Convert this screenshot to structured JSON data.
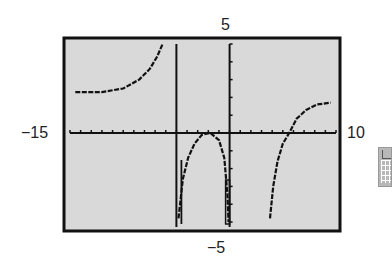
{
  "chart_data": {
    "type": "line",
    "title": "",
    "xlabel": "",
    "ylabel": "",
    "xlim": [
      -15,
      10
    ],
    "ylim": [
      -5,
      5
    ],
    "grid": false,
    "axis_tick_labels": {
      "xmin": "−15",
      "xmax": "10",
      "ymax": "5",
      "ymin": "−5"
    },
    "x_scale_ticks": 1,
    "y_scale_ticks": 1,
    "vertical_asymptotes": [
      -5,
      0
    ],
    "background": "#d9d9d9",
    "series": [
      {
        "name": "left-branch",
        "points": [
          [
            -14.5,
            2.3
          ],
          [
            -12,
            2.3
          ],
          [
            -10,
            2.5
          ],
          [
            -8.5,
            3.0
          ],
          [
            -7.5,
            3.6
          ],
          [
            -6.8,
            4.3
          ],
          [
            -6.3,
            5
          ]
        ]
      },
      {
        "name": "middle-branch",
        "points": [
          [
            -4.8,
            -4.8
          ],
          [
            -4.4,
            -2.6
          ],
          [
            -3.9,
            -1.4
          ],
          [
            -3.3,
            -0.6
          ],
          [
            -2.6,
            -0.1
          ],
          [
            -1.8,
            0
          ],
          [
            -1.0,
            -0.4
          ],
          [
            -0.5,
            -1.4
          ],
          [
            -0.2,
            -3.5
          ],
          [
            -0.1,
            -5
          ]
        ]
      },
      {
        "name": "right-branch",
        "points": [
          [
            3.8,
            -4.8
          ],
          [
            4.1,
            -3.0
          ],
          [
            4.5,
            -1.6
          ],
          [
            5.0,
            -0.6
          ],
          [
            5.6,
            0
          ],
          [
            6.3,
            0.8
          ],
          [
            7.2,
            1.3
          ],
          [
            8.2,
            1.6
          ],
          [
            9.5,
            1.7
          ]
        ]
      }
    ]
  },
  "labels": {
    "ymax": "5",
    "ymin": "−5",
    "xmin": "−15",
    "xmax": "10"
  },
  "side_icon": "graph-table-icon"
}
